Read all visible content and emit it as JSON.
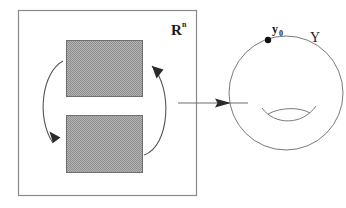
{
  "figure": {
    "type": "mathematical-diagram",
    "width": 346,
    "height": 208,
    "background_color": "#ffffff"
  },
  "domain_panel": {
    "name": "domain-box",
    "label": {
      "base": "R",
      "superscript": "n",
      "full": "Rⁿ"
    },
    "box": {
      "x": 18,
      "y": 10,
      "width": 178,
      "height": 185
    },
    "stroke_color": "#8a8a8a"
  },
  "regions": [
    {
      "name": "upper-region",
      "x": 66,
      "y": 40,
      "width": 76,
      "height": 56,
      "fill_color": "#a8a8a8",
      "stroke_color": "#6f6f6f"
    },
    {
      "name": "lower-region",
      "x": 66,
      "y": 115,
      "width": 76,
      "height": 57,
      "fill_color": "#a8a8a8",
      "stroke_color": "#6f6f6f"
    }
  ],
  "rotation_arrows": [
    {
      "name": "left-arc-arrow",
      "direction": "downward",
      "stroke_color": "#555555"
    },
    {
      "name": "right-arc-arrow",
      "direction": "upward",
      "stroke_color": "#555555"
    }
  ],
  "map_arrow": {
    "name": "map-arrow",
    "from_x": 178,
    "to_x": 248,
    "y": 103,
    "stroke_color": "#6e6e6e"
  },
  "codomain_panel": {
    "name": "codomain-sphere",
    "label": "Y",
    "circle": {
      "cx": 286,
      "cy": 93,
      "r": 57
    },
    "stroke_color": "#7a7a7a",
    "handle": {
      "name": "sphere-handle",
      "description": "lens-shaped pair of arcs indicating a handle"
    },
    "basepoint": {
      "name": "basepoint-marker",
      "label_base": "y",
      "label_subscript": "0",
      "label_full": "y₀",
      "x": 268,
      "y": 40,
      "dot_radius": 3.2,
      "dot_color": "#111111"
    }
  }
}
